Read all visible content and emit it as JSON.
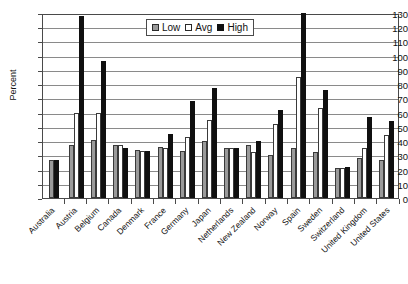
{
  "chart_data": {
    "type": "bar",
    "title": "",
    "xlabel": "",
    "ylabel": "Percent",
    "ylim": [
      0,
      130
    ],
    "ystep": 10,
    "grid": true,
    "legend_position": "top-center",
    "categories": [
      "Australia",
      "Austria",
      "Belgium",
      "Canada",
      "Denmark",
      "France",
      "Germany",
      "Japan",
      "Netherlands",
      "New Zealand",
      "Norway",
      "Spain",
      "Sweden",
      "Switzerland",
      "United Kingdom",
      "United States"
    ],
    "series": [
      {
        "name": "Low",
        "color": "#9a9a9a",
        "values": [
          27,
          37,
          41,
          37,
          34,
          36,
          33,
          40,
          35,
          37,
          30,
          35,
          32,
          21,
          28,
          27
        ]
      },
      {
        "name": "Avg",
        "color": "#ffffff",
        "values": [
          0,
          60,
          60,
          37,
          33,
          35,
          43,
          55,
          35,
          32,
          52,
          85,
          63,
          21,
          35,
          44
        ]
      },
      {
        "name": "High",
        "color": "#101010",
        "values": [
          27,
          128,
          96,
          35,
          33,
          45,
          68,
          77,
          35,
          40,
          62,
          130,
          76,
          22,
          57,
          54
        ]
      }
    ],
    "ytick_labels": [
      "130",
      "120",
      "110",
      "100",
      "90",
      "80",
      "70",
      "60",
      "50",
      "40",
      "30",
      "20",
      "10",
      "0"
    ]
  },
  "legend": {
    "items": [
      {
        "label": "Low"
      },
      {
        "label": "Avg"
      },
      {
        "label": "High"
      }
    ]
  },
  "axes": {
    "y_title": "Percent"
  },
  "title_strip": ""
}
